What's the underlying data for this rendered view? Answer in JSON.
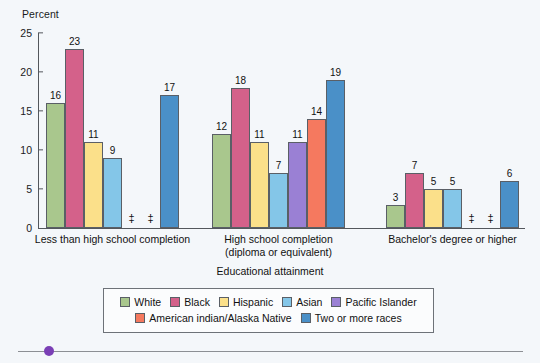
{
  "chart_data": {
    "type": "bar",
    "title": "",
    "ylabel": "Percent",
    "xlabel": "Educational attainment",
    "ylim": [
      0,
      25
    ],
    "yticks": [
      0,
      5,
      10,
      15,
      20,
      25
    ],
    "grid": false,
    "legend_position": "bottom",
    "suppressed_symbol": "‡",
    "suppressed_note": "‡ Reporting standards not met (value suppressed)",
    "categories": [
      "Less than high school completion",
      "High school completion (diploma or equivalent)",
      "Bachelor's degree or higher"
    ],
    "category_lines": [
      [
        "Less than high school completion"
      ],
      [
        "High school completion",
        "(diploma or equivalent)"
      ],
      [
        "Bachelor's degree or higher"
      ]
    ],
    "series": [
      {
        "name": "White",
        "color": "#a9c78d",
        "values": [
          16,
          12,
          3
        ]
      },
      {
        "name": "Black",
        "color": "#d4618a",
        "values": [
          23,
          18,
          7
        ]
      },
      {
        "name": "Hispanic",
        "color": "#fbe08a",
        "values": [
          11,
          11,
          5
        ]
      },
      {
        "name": "Asian",
        "color": "#84c6e8",
        "values": [
          9,
          7,
          5
        ]
      },
      {
        "name": "Pacific Islander",
        "color": "#9a80d4",
        "values": [
          null,
          11,
          null
        ]
      },
      {
        "name": "American indian/Alaska Native",
        "color": "#f5795f",
        "values": [
          null,
          14,
          null
        ]
      },
      {
        "name": "Two or more races",
        "color": "#4a90c8",
        "values": [
          17,
          19,
          6
        ]
      }
    ]
  },
  "legend": {
    "row1": [
      "White",
      "Black",
      "Hispanic",
      "Asian",
      "Pacific Islander"
    ],
    "row2": [
      "American indian/Alaska Native",
      "Two or more races"
    ]
  }
}
